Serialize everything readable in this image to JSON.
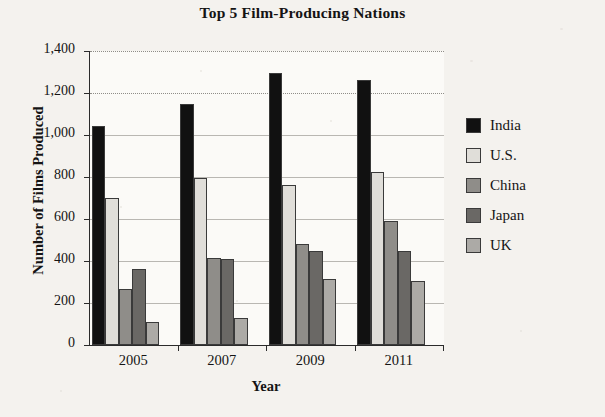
{
  "chart_data": {
    "type": "bar",
    "title": "Top 5 Film-Producing Nations",
    "xlabel": "Year",
    "ylabel": "Number of Films Produced",
    "categories": [
      "2005",
      "2007",
      "2009",
      "2011"
    ],
    "ylim": [
      0,
      1400
    ],
    "yticks": [
      0,
      200,
      400,
      600,
      800,
      1000,
      1200,
      1400
    ],
    "ytick_labels": [
      "0",
      "200",
      "400",
      "600",
      "800",
      "1,000",
      "1,200",
      "1,400"
    ],
    "grid": true,
    "legend_position": "right",
    "series": [
      {
        "name": "India",
        "color": "#111111",
        "values": [
          1045,
          1150,
          1295,
          1260
        ]
      },
      {
        "name": "U.S.",
        "color": "#e0ded9",
        "values": [
          700,
          795,
          760,
          825
        ]
      },
      {
        "name": "China",
        "color": "#8f8d89",
        "values": [
          265,
          415,
          480,
          590
        ]
      },
      {
        "name": "Japan",
        "color": "#6a6865",
        "values": [
          360,
          410,
          450,
          450
        ]
      },
      {
        "name": "UK",
        "color": "#acaaa6",
        "values": [
          110,
          130,
          315,
          305
        ]
      }
    ]
  }
}
